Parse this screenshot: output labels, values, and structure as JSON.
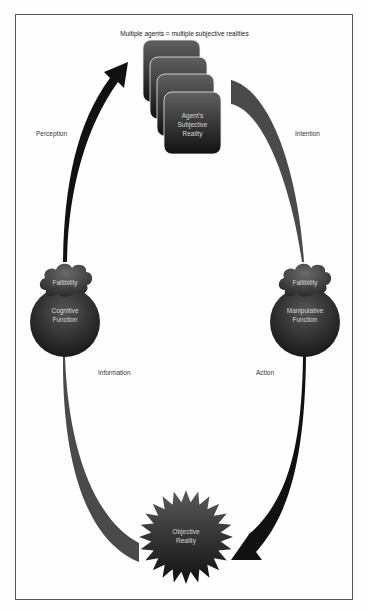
{
  "diagram": {
    "title": "Multiple agents = multiple subjective realities",
    "nodes": {
      "subjective_reality": {
        "label_lines": [
          "Agent's",
          "Subjective",
          "Reality"
        ],
        "shape": "stacked-rounded-rect",
        "count": 4
      },
      "cognitive_function": {
        "label_lines": [
          "Cognitive",
          "Function"
        ],
        "shape": "circle"
      },
      "manipulative_function": {
        "label_lines": [
          "Manipulative",
          "Function"
        ],
        "shape": "circle"
      },
      "fallibility_left": {
        "label": "Fallibility",
        "shape": "cloud"
      },
      "fallibility_right": {
        "label": "Fallibility",
        "shape": "cloud"
      },
      "objective_reality": {
        "label_lines": [
          "Objective",
          "Reality"
        ],
        "shape": "starburst"
      }
    },
    "edges": {
      "perception": {
        "label": "Perception",
        "from": "cognitive_function",
        "to": "subjective_reality",
        "color": "#111111"
      },
      "intention": {
        "label": "Intention",
        "from": "subjective_reality",
        "to": "manipulative_function",
        "color": "#4a4a4a"
      },
      "action": {
        "label": "Action",
        "from": "manipulative_function",
        "to": "objective_reality",
        "color": "#111111"
      },
      "information": {
        "label": "Information",
        "from": "objective_reality",
        "to": "cognitive_function",
        "color": "#4a4a4a"
      }
    },
    "colors": {
      "node_dark": "#1a1a1a",
      "node_mid": "#5a5a5a",
      "frame_border": "#555555"
    }
  }
}
